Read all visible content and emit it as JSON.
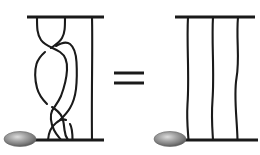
{
  "figure": {
    "caption": "Braid relation: a three-strand braid with crossings is equivalent to the trivial three-strand braid",
    "background_color": "#ffffff",
    "stroke_color": "#1a1a1a",
    "width": 260,
    "height": 155
  },
  "relation": {
    "operator_symbol": "=",
    "operator_name": "equals-sign",
    "operator_bars": 2
  },
  "left_diagram": {
    "name": "braided-three-strand-diagram",
    "label": "Braided three-strand diagram",
    "strand_count": 3,
    "crossing_count": 3,
    "top_bar": {
      "x1": 27,
      "x2": 104,
      "y": 17
    },
    "bottom_bar": {
      "x1": 30,
      "x2": 104,
      "y": 140
    },
    "top_anchors": [
      37,
      65,
      92
    ],
    "bottom_anchors": [
      40,
      68,
      92
    ],
    "bead": {
      "name": "left-bead",
      "cx": 20,
      "cy": 139,
      "rx": 16,
      "ry": 7.5,
      "highlight_color": "#d8d8d8",
      "mid_color": "#8c8c8c",
      "edge_color": "#4a4a4a"
    },
    "crossings": [
      {
        "index": 1,
        "label": "upper-crossing",
        "type": "over-right",
        "y": 46
      },
      {
        "index": 2,
        "label": "middle-crossing",
        "type": "over-left",
        "y": 104
      },
      {
        "index": 3,
        "label": "lower-crossing",
        "type": "over-right",
        "y": 127
      }
    ]
  },
  "right_diagram": {
    "name": "trivial-three-strand-diagram",
    "label": "Trivial three-strand diagram",
    "strand_count": 3,
    "crossing_count": 0,
    "top_bar": {
      "x1": 175,
      "x2": 255,
      "y": 17
    },
    "bottom_bar": {
      "x1": 178,
      "x2": 258,
      "y": 140
    },
    "top_anchors": [
      188,
      213,
      238
    ],
    "bottom_anchors": [
      188,
      213,
      238
    ],
    "bead": {
      "name": "right-bead",
      "cx": 170,
      "cy": 139,
      "rx": 16,
      "ry": 7.5,
      "highlight_color": "#d8d8d8",
      "mid_color": "#8c8c8c",
      "edge_color": "#4a4a4a"
    }
  }
}
